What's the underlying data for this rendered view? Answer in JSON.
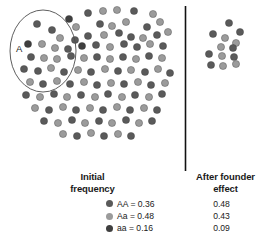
{
  "figure": {
    "ellipse_label": "A",
    "divider": "vertical-rule"
  },
  "columns": {
    "initial_line1": "Initial",
    "initial_line2": "frequency",
    "after_line1": "After founder",
    "after_line2": "effect"
  },
  "legend": [
    {
      "genotype": "AA = 0.36",
      "color": "#5a5a5a",
      "after": "0.48"
    },
    {
      "genotype": "Aa = 0.48",
      "color": "#9b9b9b",
      "after": "0.43"
    },
    {
      "genotype": "aa = 0.16",
      "color": "#3f3f3f",
      "after": "0.09"
    }
  ],
  "chart_data": {
    "type": "scatter",
    "xlabel": "",
    "ylabel": "",
    "grid": false,
    "legend_position": "bottom",
    "categories": [
      "AA",
      "Aa",
      "aa"
    ],
    "series": [
      {
        "name": "Initial frequency",
        "values": [
          0.36,
          0.48,
          0.16
        ]
      },
      {
        "name": "After founder effect",
        "values": [
          0.48,
          0.43,
          0.09
        ]
      }
    ],
    "colors": {
      "AA": "#5a5a5a",
      "Aa": "#9b9b9b",
      "aa": "#3f3f3f"
    },
    "annotations": [
      {
        "label": "A",
        "shape": "ellipse",
        "note": "founder subgroup drawn from source population"
      }
    ],
    "source_population": {
      "count": 104,
      "points": [
        [
          88,
          13,
          "AA"
        ],
        [
          103,
          11,
          "Aa"
        ],
        [
          117,
          10,
          "Aa"
        ],
        [
          134,
          11,
          "AA"
        ],
        [
          153,
          14,
          "Aa"
        ],
        [
          69,
          19,
          "aa"
        ],
        [
          76,
          27,
          "Aa"
        ],
        [
          100,
          24,
          "AA"
        ],
        [
          112,
          26,
          "Aa"
        ],
        [
          126,
          22,
          "Aa"
        ],
        [
          147,
          27,
          "AA"
        ],
        [
          160,
          22,
          "Aa"
        ],
        [
          37,
          24,
          "AA"
        ],
        [
          52,
          30,
          "AA"
        ],
        [
          60,
          38,
          "Aa"
        ],
        [
          75,
          40,
          "AA"
        ],
        [
          88,
          36,
          "AA"
        ],
        [
          104,
          35,
          "Aa"
        ],
        [
          119,
          33,
          "AA"
        ],
        [
          131,
          37,
          "AA"
        ],
        [
          143,
          38,
          "Aa"
        ],
        [
          157,
          35,
          "AA"
        ],
        [
          168,
          32,
          "Aa"
        ],
        [
          28,
          44,
          "aa"
        ],
        [
          42,
          44,
          "Aa"
        ],
        [
          55,
          48,
          "Aa"
        ],
        [
          68,
          49,
          "AA"
        ],
        [
          82,
          46,
          "aa"
        ],
        [
          96,
          45,
          "AA"
        ],
        [
          110,
          47,
          "Aa"
        ],
        [
          124,
          44,
          "AA"
        ],
        [
          137,
          47,
          "AA"
        ],
        [
          150,
          44,
          "Aa"
        ],
        [
          163,
          46,
          "AA"
        ],
        [
          31,
          57,
          "AA"
        ],
        [
          44,
          58,
          "Aa"
        ],
        [
          57,
          59,
          "Aa"
        ],
        [
          71,
          56,
          "AA"
        ],
        [
          84,
          58,
          "Aa"
        ],
        [
          97,
          57,
          "AA"
        ],
        [
          110,
          59,
          "Aa"
        ],
        [
          123,
          57,
          "AA"
        ],
        [
          136,
          59,
          "Aa"
        ],
        [
          149,
          56,
          "AA"
        ],
        [
          162,
          58,
          "Aa"
        ],
        [
          24,
          69,
          "AA"
        ],
        [
          38,
          71,
          "AA"
        ],
        [
          51,
          68,
          "Aa"
        ],
        [
          64,
          72,
          "AA"
        ],
        [
          78,
          70,
          "Aa"
        ],
        [
          91,
          72,
          "AA"
        ],
        [
          105,
          69,
          "Aa"
        ],
        [
          118,
          71,
          "AA"
        ],
        [
          131,
          70,
          "Aa"
        ],
        [
          145,
          72,
          "AA"
        ],
        [
          158,
          69,
          "Aa"
        ],
        [
          170,
          73,
          "AA"
        ],
        [
          30,
          82,
          "Aa"
        ],
        [
          43,
          84,
          "AA"
        ],
        [
          57,
          81,
          "Aa"
        ],
        [
          70,
          84,
          "AA"
        ],
        [
          84,
          82,
          "Aa"
        ],
        [
          97,
          85,
          "AA"
        ],
        [
          111,
          83,
          "Aa"
        ],
        [
          124,
          84,
          "AA"
        ],
        [
          138,
          82,
          "Aa"
        ],
        [
          151,
          85,
          "AA"
        ],
        [
          165,
          83,
          "Aa"
        ],
        [
          26,
          95,
          "AA"
        ],
        [
          40,
          97,
          "Aa"
        ],
        [
          54,
          94,
          "AA"
        ],
        [
          67,
          97,
          "Aa"
        ],
        [
          81,
          95,
          "AA"
        ],
        [
          95,
          97,
          "Aa"
        ],
        [
          108,
          94,
          "AA"
        ],
        [
          122,
          97,
          "Aa"
        ],
        [
          135,
          95,
          "AA"
        ],
        [
          149,
          97,
          "Aa"
        ],
        [
          162,
          94,
          "AA"
        ],
        [
          35,
          108,
          "Aa"
        ],
        [
          49,
          110,
          "AA"
        ],
        [
          63,
          107,
          "Aa"
        ],
        [
          76,
          110,
          "AA"
        ],
        [
          90,
          108,
          "Aa"
        ],
        [
          103,
          110,
          "AA"
        ],
        [
          117,
          107,
          "Aa"
        ],
        [
          130,
          110,
          "AA"
        ],
        [
          144,
          108,
          "Aa"
        ],
        [
          157,
          110,
          "AA"
        ],
        [
          44,
          121,
          "AA"
        ],
        [
          58,
          123,
          "Aa"
        ],
        [
          72,
          120,
          "AA"
        ],
        [
          85,
          123,
          "Aa"
        ],
        [
          99,
          121,
          "AA"
        ],
        [
          112,
          123,
          "Aa"
        ],
        [
          126,
          120,
          "AA"
        ],
        [
          139,
          123,
          "Aa"
        ],
        [
          152,
          121,
          "AA"
        ],
        [
          63,
          134,
          "Aa"
        ],
        [
          77,
          136,
          "AA"
        ],
        [
          91,
          133,
          "Aa"
        ],
        [
          104,
          136,
          "AA"
        ],
        [
          118,
          134,
          "Aa"
        ],
        [
          131,
          136,
          "AA"
        ]
      ]
    },
    "founder_population": {
      "count": 13,
      "points": [
        [
          229,
          23,
          "AA"
        ],
        [
          213,
          34,
          "AA"
        ],
        [
          240,
          32,
          "AA"
        ],
        [
          225,
          38,
          "Aa"
        ],
        [
          236,
          43,
          "Aa"
        ],
        [
          221,
          47,
          "Aa"
        ],
        [
          233,
          48,
          "AA"
        ],
        [
          209,
          54,
          "AA"
        ],
        [
          222,
          56,
          "Aa"
        ],
        [
          234,
          57,
          "AA"
        ],
        [
          211,
          65,
          "AA"
        ],
        [
          223,
          66,
          "Aa"
        ],
        [
          236,
          64,
          "Aa"
        ]
      ]
    },
    "ellipse": {
      "cx": 43,
      "cy": 51,
      "rx": 33,
      "ry": 41
    }
  }
}
